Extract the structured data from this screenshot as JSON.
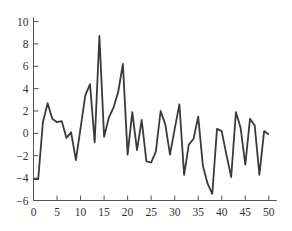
{
  "chart_data": {
    "type": "line",
    "title": "",
    "xlabel": "",
    "ylabel": "",
    "xlim": [
      0,
      50
    ],
    "ylim": [
      -6,
      10
    ],
    "grid": false,
    "legend": null,
    "xticks": [
      0,
      5,
      10,
      15,
      20,
      25,
      30,
      35,
      40,
      45,
      50
    ],
    "yticks": [
      -6,
      -4,
      -2,
      0,
      2,
      4,
      6,
      8,
      10
    ],
    "series": [
      {
        "name": "series",
        "color": "#3a3a3a",
        "x": [
          0,
          1,
          2,
          3,
          4,
          5,
          6,
          7,
          8,
          9,
          10,
          11,
          12,
          13,
          14,
          15,
          16,
          17,
          18,
          19,
          20,
          21,
          22,
          23,
          24,
          25,
          26,
          27,
          28,
          29,
          30,
          31,
          32,
          33,
          34,
          35,
          36,
          37,
          38,
          39,
          40,
          41,
          42,
          43,
          44,
          45,
          46,
          47,
          48,
          49,
          50
        ],
        "values": [
          -4.1,
          -4.1,
          1.0,
          2.7,
          1.3,
          1.0,
          1.1,
          -0.4,
          0.1,
          -2.4,
          0.5,
          3.4,
          4.4,
          -0.8,
          8.7,
          -0.3,
          1.4,
          2.3,
          3.7,
          6.2,
          -1.9,
          1.9,
          -1.5,
          1.2,
          -2.5,
          -2.6,
          -1.6,
          2.0,
          0.8,
          -1.9,
          0.4,
          2.6,
          -3.7,
          -1.0,
          -0.5,
          1.5,
          -2.9,
          -4.5,
          -5.4,
          0.4,
          0.2,
          -1.9,
          -3.9,
          1.9,
          0.5,
          -2.8,
          1.3,
          0.7,
          -3.7,
          0.2,
          -0.1
        ]
      }
    ]
  }
}
